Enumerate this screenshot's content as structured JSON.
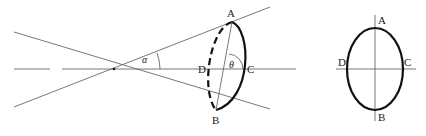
{
  "figure": {
    "left_view": {
      "labels": {
        "A": "A",
        "B": "B",
        "C": "C",
        "D": "D",
        "alpha": "α",
        "theta": "θ"
      },
      "description": "Cone of half-angle alpha with apex on the axis; a tilted elliptical cross-section ABCD, with the far half (D side) drawn dashed, and the angle theta between chord AB and the axis at the section"
    },
    "right_view": {
      "labels": {
        "A": "A",
        "B": "B",
        "C": "C",
        "D": "D"
      },
      "description": "Front view of the elliptical section with vertical axis AB and horizontal axis DC"
    }
  }
}
